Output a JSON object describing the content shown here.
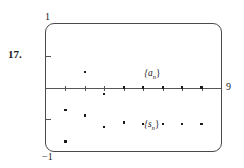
{
  "exercise": {
    "number_label": "17."
  },
  "graph": {
    "window": {
      "xmin": 0,
      "xmax": 9,
      "ymin": -1,
      "ymax": 1,
      "xmax_label": "9",
      "ymax_label": "1",
      "ymin_label": "−1",
      "xscl": 1,
      "yscl": 0.5
    },
    "frame": {
      "style": "rounded-rectangle",
      "color": "#4a4a4a"
    },
    "axis_color": "#555555",
    "point_color": "#1a1a1a",
    "annotations": [
      {
        "name": "a-sequence-label",
        "text": "{a",
        "sub": "n",
        "close": "}",
        "x": 5.05,
        "y": 0.3
      },
      {
        "name": "s-sequence-label",
        "text": "{s",
        "sub": "n",
        "close": "}",
        "x": 5.05,
        "y": -0.5
      }
    ]
  },
  "chart_data": {
    "type": "scatter",
    "title": "",
    "xlabel": "",
    "ylabel": "",
    "xlim": [
      0,
      9
    ],
    "ylim": [
      -1,
      1
    ],
    "grid": false,
    "legend": "in-plot annotations",
    "x_ticks": [
      1,
      2,
      3,
      4,
      5,
      6,
      7,
      8
    ],
    "y_ticks": [
      -0.5,
      0.5
    ],
    "series": [
      {
        "name": "{a_n}",
        "marker": "dot",
        "color": "#1a1a1a",
        "x": [
          1,
          2,
          3,
          4,
          5,
          6,
          7,
          8
        ],
        "y": [
          -0.35,
          0.25,
          -0.1,
          0.0,
          0.0,
          0.0,
          0.0,
          0.0
        ]
      },
      {
        "name": "{s_n}",
        "marker": "dot",
        "color": "#1a1a1a",
        "x": [
          1,
          2,
          3,
          4,
          5,
          6,
          7,
          8
        ],
        "y": [
          -0.85,
          -0.44,
          -0.62,
          -0.55,
          -0.58,
          -0.58,
          -0.58,
          -0.58
        ]
      }
    ]
  }
}
